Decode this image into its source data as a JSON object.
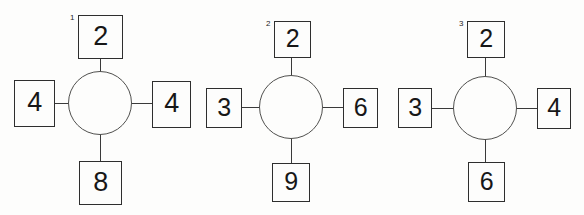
{
  "diagram": {
    "type": "node-spoke-diagram",
    "background_color": "#fdfdfc",
    "line_color": "#2e2e2e",
    "text_color": "#171717",
    "figures": [
      {
        "index_label": "1",
        "center": {
          "x": 100,
          "y": 103,
          "radius": 32
        },
        "cells": {
          "top": {
            "value": "2",
            "x": 78,
            "y": 15,
            "w": 45,
            "h": 44,
            "font_size": 27
          },
          "left": {
            "value": "4",
            "x": 14,
            "y": 80,
            "w": 41,
            "h": 47,
            "font_size": 27
          },
          "right": {
            "value": "4",
            "x": 152,
            "y": 81,
            "w": 39,
            "h": 47,
            "font_size": 27
          },
          "bottom": {
            "value": "8",
            "x": 79,
            "y": 161,
            "w": 43,
            "h": 44,
            "font_size": 27
          }
        }
      },
      {
        "index_label": "2",
        "center": {
          "x": 291,
          "y": 107,
          "radius": 32
        },
        "cells": {
          "top": {
            "value": "2",
            "x": 274,
            "y": 21,
            "w": 37,
            "h": 37,
            "font_size": 25
          },
          "left": {
            "value": "3",
            "x": 206,
            "y": 88,
            "w": 36,
            "h": 40,
            "font_size": 25
          },
          "right": {
            "value": "6",
            "x": 343,
            "y": 88,
            "w": 35,
            "h": 40,
            "font_size": 25
          },
          "bottom": {
            "value": "9",
            "x": 272,
            "y": 163,
            "w": 38,
            "h": 39,
            "font_size": 25
          }
        }
      },
      {
        "index_label": "3",
        "center": {
          "x": 485,
          "y": 108,
          "radius": 32
        },
        "cells": {
          "top": {
            "value": "2",
            "x": 467,
            "y": 21,
            "w": 38,
            "h": 37,
            "font_size": 25
          },
          "left": {
            "value": "3",
            "x": 398,
            "y": 88,
            "w": 34,
            "h": 40,
            "font_size": 25
          },
          "right": {
            "value": "4",
            "x": 537,
            "y": 88,
            "w": 34,
            "h": 41,
            "font_size": 25
          },
          "bottom": {
            "value": "6",
            "x": 468,
            "y": 162,
            "w": 37,
            "h": 40,
            "font_size": 25
          }
        }
      }
    ]
  }
}
